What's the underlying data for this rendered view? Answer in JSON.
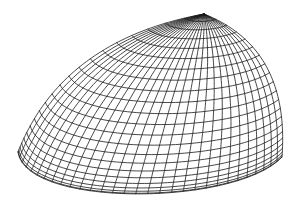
{
  "figure": {
    "title": "",
    "background": "#ffffff",
    "line_color": "#1a1a1a",
    "line_width": 0.8,
    "apex": [
      204,
      14
    ],
    "left_corner": [
      18,
      152
    ],
    "right_corner": [
      282,
      157
    ],
    "left_edge_control": [
      62,
      40
    ],
    "right_edge_control": [
      290,
      48
    ],
    "rim_controls": [
      [
        26,
        208
      ],
      [
        236,
        206
      ]
    ],
    "ring_count": 22,
    "meridian_count": 30
  }
}
